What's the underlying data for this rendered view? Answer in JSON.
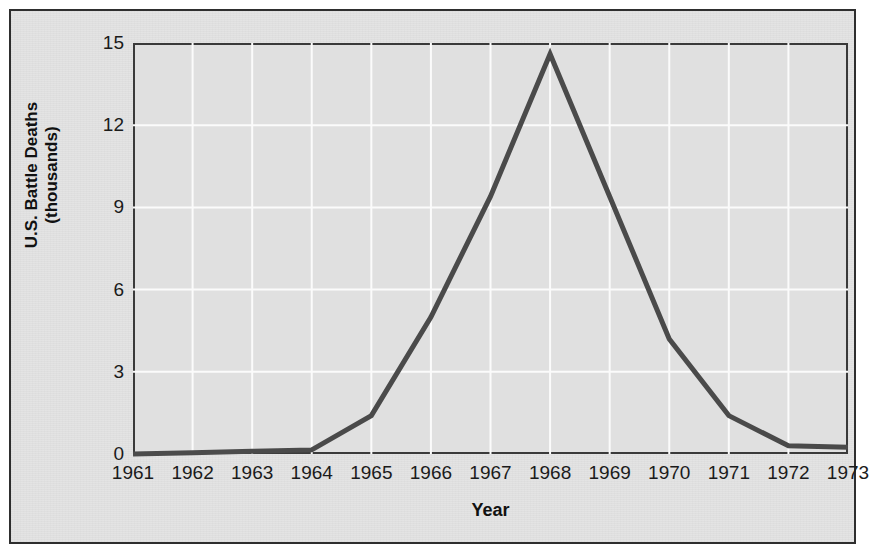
{
  "chart_data": {
    "type": "line",
    "title": "",
    "xlabel": "Year",
    "ylabel_line1": "U.S. Battle Deaths",
    "ylabel_line2": "(thousands)",
    "categories": [
      "1961",
      "1962",
      "1963",
      "1964",
      "1965",
      "1966",
      "1967",
      "1968",
      "1969",
      "1970",
      "1971",
      "1972",
      "1973"
    ],
    "values": [
      0.0,
      0.05,
      0.1,
      0.15,
      1.4,
      5.0,
      9.4,
      14.6,
      9.4,
      4.2,
      1.4,
      0.3,
      0.25
    ],
    "x": [
      1961,
      1962,
      1963,
      1964,
      1965,
      1966,
      1967,
      1968,
      1969,
      1970,
      1971,
      1972,
      1973
    ],
    "ylim": [
      0,
      15
    ],
    "xlim": [
      1961,
      1973
    ],
    "yticks": [
      0,
      3,
      6,
      9,
      12,
      15
    ],
    "ytick_labels": [
      "0",
      "3",
      "6",
      "9",
      "12",
      "15"
    ],
    "xtick_labels": [
      "1961",
      "1962",
      "1963",
      "1964",
      "1965",
      "1966",
      "1967",
      "1968",
      "1969",
      "1970",
      "1971",
      "1972",
      "1973"
    ],
    "grid": true,
    "grid_color": "#fbfbfb",
    "legend": "none",
    "line_color": "#4a4a4a",
    "line_width": 5,
    "plot_background": "#e0e0e0",
    "page_background": "#e3e3e3",
    "frame_color": "#2e2e2e",
    "axis_color": "#3a3a3a",
    "text_color": "#1b1b1b"
  }
}
